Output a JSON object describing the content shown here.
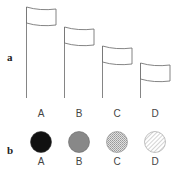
{
  "panels": {
    "a": {
      "label": "a"
    },
    "b": {
      "label": "b"
    }
  },
  "flags": [
    {
      "label": "A"
    },
    {
      "label": "B"
    },
    {
      "label": "C"
    },
    {
      "label": "D"
    }
  ],
  "circles": [
    {
      "label": "A",
      "fill": "solid-black",
      "color": "#111111"
    },
    {
      "label": "B",
      "fill": "solid-gray",
      "color": "#888888"
    },
    {
      "label": "C",
      "fill": "stipple-light",
      "color": "#c8c8c8"
    },
    {
      "label": "D",
      "fill": "hatch",
      "color": "#bbbbbb"
    }
  ]
}
